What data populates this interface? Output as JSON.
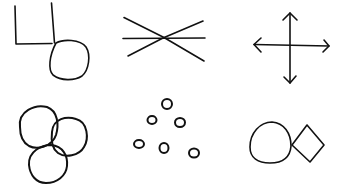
{
  "figure": {
    "background": "#ffffff",
    "stroke_color": "#111111",
    "style": "hand-drawn line symbols",
    "layout": {
      "rows": 2,
      "columns": 3
    },
    "symbols": [
      {
        "name": "corner-lines-with-circle",
        "description": "Two vertical lines joined by a horizontal line, with a circle attached at the lower right"
      },
      {
        "name": "three-crossing-lines",
        "description": "A horizontal line crossed by two diagonal lines at a single point"
      },
      {
        "name": "four-way-arrows",
        "description": "A cross with arrowheads on all four ends"
      },
      {
        "name": "three-overlapping-circles",
        "description": "Three overlapping circles"
      },
      {
        "name": "scattered-small-circles",
        "description": "Six small scattered rings"
      },
      {
        "name": "circle-and-diamond",
        "description": "A circle touching a diamond on its right"
      }
    ]
  }
}
